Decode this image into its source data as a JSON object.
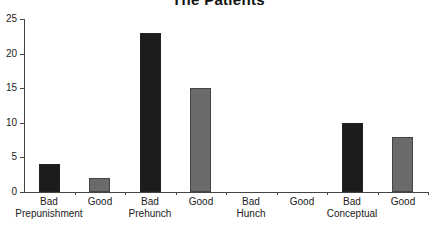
{
  "chart_data": {
    "type": "bar",
    "title": "The Patients",
    "xlabel": "",
    "ylabel": "",
    "ylim": [
      0,
      25
    ],
    "yticks": [
      0,
      5,
      10,
      15,
      20,
      25
    ],
    "grid": false,
    "legend": null,
    "categories": [
      "Bad\nPrepunishment",
      "Good",
      "Bad\nPrehunch",
      "Good",
      "Bad\nHunch",
      "Good",
      "Bad\nConceptual",
      "Good"
    ],
    "category_lines": [
      [
        "Bad",
        "Prepunishment"
      ],
      [
        "Good"
      ],
      [
        "Bad",
        "Prehunch"
      ],
      [
        "Good"
      ],
      [
        "Bad",
        "Hunch"
      ],
      [
        "Good"
      ],
      [
        "Bad",
        "Conceptual"
      ],
      [
        "Good"
      ]
    ],
    "values": [
      4,
      2,
      23,
      15,
      0,
      0,
      10,
      8
    ],
    "bar_colors": [
      "#1c1c1c",
      "#6a6a6a",
      "#1c1c1c",
      "#6a6a6a",
      "#1c1c1c",
      "#6a6a6a",
      "#1c1c1c",
      "#6a6a6a"
    ]
  }
}
